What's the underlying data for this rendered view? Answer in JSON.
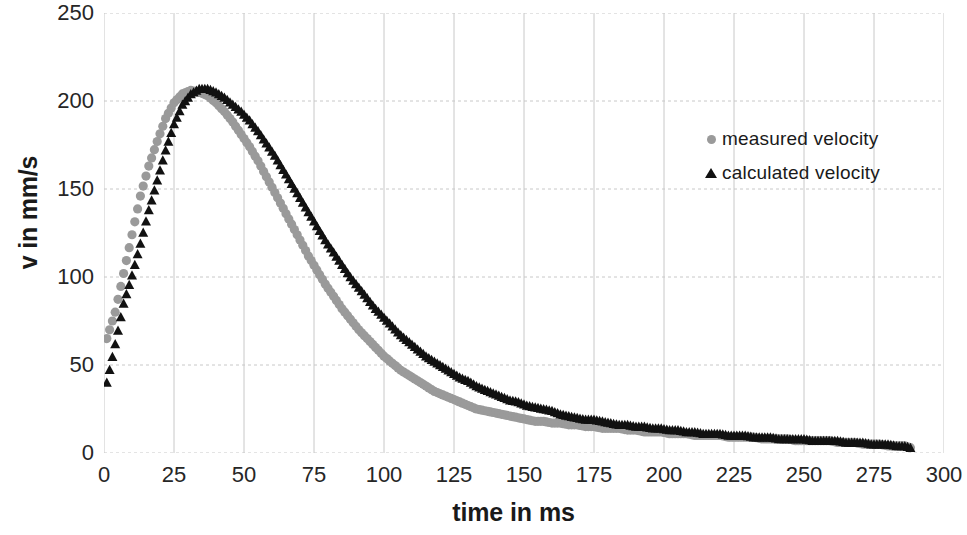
{
  "chart_data": {
    "type": "scatter",
    "title": "",
    "xlabel": "time in ms",
    "ylabel": "v in mm/s",
    "xlim": [
      0,
      300
    ],
    "ylim": [
      0,
      250
    ],
    "xticks": [
      0,
      25,
      50,
      75,
      100,
      125,
      150,
      175,
      200,
      225,
      250,
      275,
      300
    ],
    "yticks": [
      0,
      50,
      100,
      150,
      200,
      250
    ],
    "grid": true,
    "legend_position": "inside-upper-right",
    "series": [
      {
        "name": "measured velocity",
        "marker": "circle",
        "color": "#9a9a9a",
        "x": [
          1,
          4,
          7,
          10,
          13,
          16,
          19,
          22,
          25,
          28,
          31,
          34,
          37,
          40,
          43,
          46,
          49,
          52,
          55,
          58,
          61,
          64,
          67,
          70,
          73,
          76,
          79,
          82,
          85,
          88,
          91,
          94,
          97,
          100,
          103,
          106,
          109,
          112,
          115,
          118,
          121,
          124,
          127,
          130,
          133,
          136,
          139,
          142,
          145,
          148,
          151,
          154,
          157,
          160,
          163,
          166,
          169,
          172,
          175,
          178,
          181,
          184,
          187,
          190,
          193,
          196,
          199,
          202,
          205,
          208,
          211,
          214,
          217,
          220,
          223,
          226,
          229,
          232,
          235,
          238,
          241,
          244,
          247,
          250,
          253,
          256,
          259,
          262,
          265,
          268,
          271,
          274,
          277,
          280,
          283,
          286,
          288
        ],
        "y": [
          65,
          80,
          102,
          124,
          146,
          163,
          177,
          190,
          199,
          204,
          206,
          205,
          203,
          199,
          194,
          188,
          181,
          174,
          166,
          157,
          148,
          139,
          130,
          121,
          112,
          104,
          96,
          89,
          82,
          76,
          70,
          65,
          60,
          55,
          51,
          47,
          44,
          41,
          38,
          35,
          33,
          31,
          29,
          27,
          25,
          24,
          23,
          22,
          21,
          20,
          19,
          18,
          18,
          17,
          17,
          16,
          16,
          15,
          15,
          14,
          14,
          14,
          13,
          13,
          12,
          12,
          12,
          11,
          11,
          11,
          10,
          10,
          10,
          10,
          9,
          9,
          9,
          9,
          8,
          8,
          8,
          8,
          7,
          7,
          7,
          7,
          7,
          6,
          6,
          6,
          5,
          5,
          5,
          4,
          4,
          4,
          3
        ]
      },
      {
        "name": "calculated velocity",
        "marker": "triangle",
        "color": "#111111",
        "x": [
          1,
          4,
          7,
          10,
          13,
          16,
          19,
          22,
          25,
          28,
          31,
          34,
          37,
          40,
          43,
          46,
          49,
          52,
          55,
          58,
          61,
          64,
          67,
          70,
          73,
          76,
          79,
          82,
          85,
          88,
          91,
          94,
          97,
          100,
          103,
          106,
          109,
          112,
          115,
          118,
          121,
          124,
          127,
          130,
          133,
          136,
          139,
          142,
          145,
          148,
          151,
          154,
          157,
          160,
          163,
          166,
          169,
          172,
          175,
          178,
          181,
          184,
          187,
          190,
          193,
          196,
          199,
          202,
          205,
          208,
          211,
          214,
          217,
          220,
          223,
          226,
          229,
          232,
          235,
          238,
          241,
          244,
          247,
          250,
          253,
          256,
          259,
          262,
          265,
          268,
          271,
          274,
          277,
          280,
          283,
          286,
          288
        ],
        "y": [
          40,
          62,
          85,
          101,
          119,
          138,
          155,
          172,
          187,
          198,
          204,
          207,
          207,
          205,
          202,
          198,
          194,
          189,
          183,
          176,
          169,
          161,
          153,
          145,
          137,
          129,
          121,
          114,
          107,
          100,
          94,
          88,
          82,
          77,
          72,
          67,
          63,
          59,
          55,
          52,
          49,
          46,
          43,
          41,
          38,
          36,
          34,
          32,
          30,
          29,
          27,
          26,
          25,
          24,
          22,
          21,
          20,
          19,
          19,
          18,
          17,
          16,
          16,
          15,
          15,
          14,
          14,
          13,
          13,
          12,
          12,
          11,
          11,
          11,
          10,
          10,
          10,
          9,
          9,
          9,
          8,
          8,
          8,
          8,
          7,
          7,
          7,
          7,
          6,
          6,
          6,
          5,
          5,
          5,
          4,
          4,
          3
        ]
      }
    ]
  },
  "legend": {
    "entries": [
      {
        "label": "measured velocity",
        "marker": "circle-marker",
        "color": "#9a9a9a"
      },
      {
        "label": "calculated velocity",
        "marker": "triangle-marker",
        "color": "#111111"
      }
    ]
  },
  "axes": {
    "x_title": "time in ms",
    "y_title": "v in mm/s",
    "x_tick_labels": [
      "0",
      "25",
      "50",
      "75",
      "100",
      "125",
      "150",
      "175",
      "200",
      "225",
      "250",
      "275",
      "300"
    ],
    "y_tick_labels": [
      "0",
      "50",
      "100",
      "150",
      "200",
      "250"
    ]
  },
  "style": {
    "gridline_color": "#c8c8c8",
    "background": "#ffffff",
    "axis_text_color": "#262626"
  }
}
